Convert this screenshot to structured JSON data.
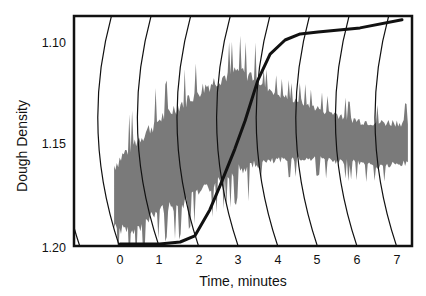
{
  "chart_data": {
    "type": "line",
    "title": "",
    "xlabel": "Time, minutes",
    "ylabel": "Dough Density",
    "x_ticks": [
      "0",
      "1",
      "2",
      "3",
      "4",
      "5",
      "6",
      "7"
    ],
    "y_ticks": [
      "1.10",
      "1.15",
      "1.20"
    ],
    "xlim": [
      -1.2,
      7.4
    ],
    "ylim": [
      1.2,
      1.087
    ],
    "y_inverted": true,
    "grid": false,
    "legend": null,
    "colors": {
      "band": "#7a7a7a",
      "curve": "#111111",
      "frame": "#111111",
      "arcs": "#111111"
    },
    "series": [
      {
        "name": "density-curve",
        "style": "thick-line",
        "points": [
          [
            0.0,
            1.2
          ],
          [
            1.0,
            1.2
          ],
          [
            1.52,
            1.199
          ],
          [
            1.89,
            1.196
          ],
          [
            2.27,
            1.183
          ],
          [
            2.53,
            1.171
          ],
          [
            2.9,
            1.153
          ],
          [
            3.16,
            1.139
          ],
          [
            3.48,
            1.119
          ],
          [
            3.79,
            1.106
          ],
          [
            4.17,
            1.099
          ],
          [
            4.55,
            1.096
          ],
          [
            5.0,
            1.095
          ],
          [
            6.06,
            1.093
          ],
          [
            7.12,
            1.089
          ]
        ]
      },
      {
        "name": "noisy-band",
        "style": "filled-band",
        "x_range": [
          -0.15,
          7.3
        ],
        "upper_envelope": [
          [
            -0.15,
            1.165
          ],
          [
            0.3,
            1.155
          ],
          [
            1.0,
            1.142
          ],
          [
            1.5,
            1.135
          ],
          [
            2.0,
            1.128
          ],
          [
            2.5,
            1.122
          ],
          [
            3.0,
            1.118
          ],
          [
            3.5,
            1.122
          ],
          [
            4.0,
            1.128
          ],
          [
            4.5,
            1.131
          ],
          [
            5.0,
            1.135
          ],
          [
            5.5,
            1.138
          ],
          [
            6.0,
            1.141
          ],
          [
            6.5,
            1.142
          ],
          [
            7.3,
            1.142
          ]
        ],
        "lower_envelope": [
          [
            -0.15,
            1.188
          ],
          [
            0.3,
            1.192
          ],
          [
            1.0,
            1.18
          ],
          [
            1.5,
            1.178
          ],
          [
            2.0,
            1.172
          ],
          [
            2.5,
            1.166
          ],
          [
            3.0,
            1.16
          ],
          [
            3.5,
            1.158
          ],
          [
            4.0,
            1.157
          ],
          [
            4.5,
            1.156
          ],
          [
            5.0,
            1.156
          ],
          [
            5.5,
            1.158
          ],
          [
            6.0,
            1.158
          ],
          [
            6.5,
            1.16
          ],
          [
            7.3,
            1.158
          ]
        ]
      }
    ],
    "arcs": {
      "description": "family of curved reference lines (one per minute tick), bowing left",
      "bottom_times": [
        0,
        1,
        2,
        3,
        4,
        5,
        6,
        7
      ]
    }
  }
}
